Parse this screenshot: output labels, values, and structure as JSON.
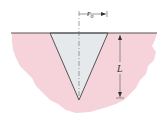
{
  "diagram": {
    "labels": {
      "radius": "r",
      "radius_sub": "o",
      "length": "L"
    },
    "colors": {
      "medium": "#f6d3da",
      "cone": "#e6e9ec",
      "line": "#555555",
      "background": "#ffffff"
    }
  }
}
